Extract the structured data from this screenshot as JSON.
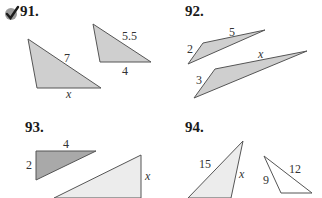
{
  "problems": [
    {
      "number": "91.",
      "checked": true,
      "labels": {
        "t1_hyp": "7",
        "t1_base": "x",
        "t2_hyp": "5.5",
        "t2_base": "4"
      }
    },
    {
      "number": "92.",
      "checked": false,
      "labels": {
        "t1_short": "2",
        "t1_long": "5",
        "t2_short": "3",
        "t2_long": "x"
      }
    },
    {
      "number": "93.",
      "checked": false,
      "labels": {
        "t1_top": "4",
        "t1_side": "2",
        "t2_side": "x"
      }
    },
    {
      "number": "94.",
      "checked": false,
      "labels": {
        "t1_left": "15",
        "t1_right": "x",
        "t2_left": "9",
        "t2_right": "12"
      }
    }
  ],
  "colors": {
    "triangle_fill": "#cfcfcf",
    "triangle_fill_dark": "#a9a9a9",
    "triangle_fill_light": "#ececec",
    "stroke": "#555555",
    "check_circle": "#8a8a8a",
    "check_mark": "#1a1a1a"
  }
}
